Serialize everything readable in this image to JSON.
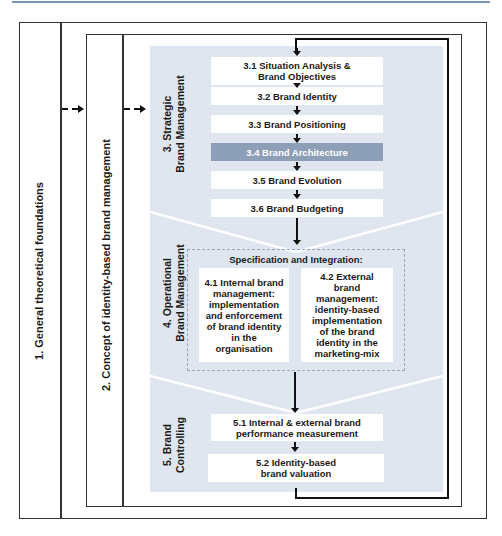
{
  "levels": {
    "level1": "1. General theoretical foundations",
    "level2": "2. Concept of identity-based brand management"
  },
  "sections": {
    "strategic": {
      "label_line1": "3. Strategic",
      "label_line2": "Brand Management",
      "steps": [
        {
          "id": "3.1",
          "line1": "3.1 Situation Analysis &",
          "line2": "Brand Objectives"
        },
        {
          "id": "3.2",
          "label": "3.2 Brand Identity"
        },
        {
          "id": "3.3",
          "label": "3.3  Brand Positioning"
        },
        {
          "id": "3.4",
          "label": "3.4 Brand Architecture",
          "highlighted": true
        },
        {
          "id": "3.5",
          "label": "3.5 Brand Evolution"
        },
        {
          "id": "3.6",
          "label": "3.6 Brand Budgeting"
        }
      ]
    },
    "operational": {
      "label_line1": "4. Operational",
      "label_line2": "Brand Management",
      "group_title": "Specification and Integration:",
      "steps": [
        {
          "id": "4.1",
          "lines": [
            "4.1 Internal brand",
            "management:",
            "implementation",
            "and enforcement",
            "of brand identity",
            "in the",
            "organisation"
          ]
        },
        {
          "id": "4.2",
          "lines": [
            "4.2 External",
            "brand",
            "management:",
            "identity-based",
            "implementation",
            "of the brand",
            "identity in the",
            "marketing-mix"
          ]
        }
      ]
    },
    "controlling": {
      "label_line1": "5. Brand",
      "label_line2": "Controlling",
      "steps": [
        {
          "id": "5.1",
          "line1": "5.1 Internal & external brand",
          "line2": "performance measurement"
        },
        {
          "id": "5.2",
          "line1": "5.2 Identity-based",
          "line2": "brand valuation"
        }
      ]
    }
  },
  "colors": {
    "panel": "#dfe6ef",
    "highlight": "#8d9fb6",
    "rule": "#7f93b8"
  }
}
